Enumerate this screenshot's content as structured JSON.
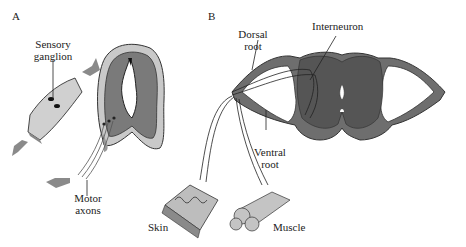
{
  "panels": {
    "a": {
      "letter": "A"
    },
    "b": {
      "letter": "B"
    }
  },
  "labels": {
    "sensory_ganglion_1": "Sensory",
    "sensory_ganglion_2": "ganglion",
    "motor_axons_1": "Motor",
    "motor_axons_2": "axons",
    "skin": "Skin",
    "dorsal_root_1": "Dorsal",
    "dorsal_root_2": "root",
    "interneuron": "Interneuron",
    "ventral_root_1": "Ventral",
    "ventral_root_2": "root",
    "muscle": "Muscle"
  },
  "colors": {
    "gray_matter": "#6f6f6f",
    "white_matter": "#a8a8a8",
    "pale": "#d4d4d4",
    "outline": "#333333",
    "arrow": "#8a8a8a"
  }
}
